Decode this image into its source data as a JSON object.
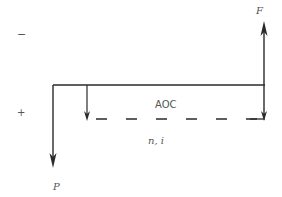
{
  "diagram": {
    "type": "cash-flow-diagram",
    "labels": {
      "sign_negative": "−",
      "sign_positive": "+",
      "future_value": "F",
      "present_value": "P",
      "annual_cost": "AOC",
      "period_rate": "n, i"
    },
    "colors": {
      "line": "#2a2a2a",
      "text": "#555555",
      "background": "#ffffff"
    },
    "elements": [
      {
        "name": "time-axis",
        "kind": "line",
        "from": [
          53,
          85
        ],
        "to": [
          265,
          85
        ]
      },
      {
        "name": "present-value-arrow",
        "kind": "arrow-down",
        "x": 53,
        "from_y": 85,
        "to_y": 167,
        "label": "P"
      },
      {
        "name": "aoc-start-arrow",
        "kind": "arrow-down",
        "x": 87,
        "from_y": 85,
        "to_y": 121
      },
      {
        "name": "aoc-dashed-line",
        "kind": "dashed-line",
        "y": 119,
        "from_x": 95,
        "to_x": 265,
        "label": "AOC"
      },
      {
        "name": "aoc-end-arrow",
        "kind": "arrow-down",
        "x": 264,
        "from_y": 85,
        "to_y": 121
      },
      {
        "name": "future-value-arrow",
        "kind": "arrow-up",
        "x": 264,
        "from_y": 85,
        "to_y": 22,
        "label": "F"
      }
    ]
  }
}
